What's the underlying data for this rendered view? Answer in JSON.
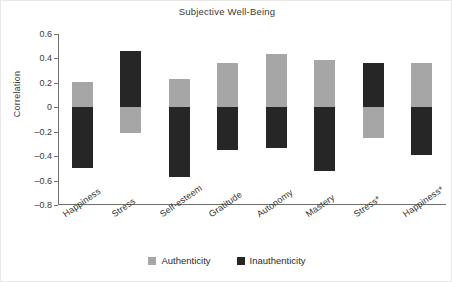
{
  "chart_data": {
    "type": "bar",
    "title": "Subjective Well-Being",
    "xlabel": "",
    "ylabel": "Correlation",
    "ylim": [
      -0.8,
      0.6
    ],
    "yticks": [
      0.6,
      0.4,
      0.2,
      0,
      -0.2,
      -0.4,
      -0.6,
      -0.8
    ],
    "ytick_labels": [
      "0.6",
      "0.4",
      "0.2",
      "0",
      "–0.2",
      "–0.4",
      "–0.6",
      "–0.8"
    ],
    "grid": false,
    "legend_position": "bottom",
    "categories": [
      "Happiness",
      "Stress",
      "Self-esteem",
      "Gratitude",
      "Autonomy",
      "Mastery",
      "Stress*",
      "Happiness*"
    ],
    "series": [
      {
        "name": "Authenticity",
        "color": "#a6a6a6",
        "values": [
          0.21,
          -0.21,
          0.23,
          0.36,
          0.44,
          0.39,
          -0.25,
          0.36
        ]
      },
      {
        "name": "Inauthenticity",
        "color": "#262626",
        "values": [
          -0.5,
          0.46,
          -0.57,
          -0.35,
          -0.33,
          -0.52,
          0.36,
          -0.39
        ]
      }
    ]
  },
  "legend": {
    "items": [
      {
        "label": "Authenticity",
        "color": "#a6a6a6"
      },
      {
        "label": "Inauthenticity",
        "color": "#262626"
      }
    ]
  }
}
